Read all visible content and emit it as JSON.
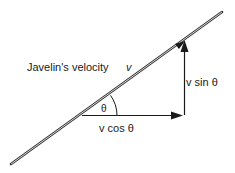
{
  "diagram": {
    "title_label": "Javelin's velocity",
    "velocity_symbol": "v",
    "angle_label": "θ",
    "horizontal_component": "v cos θ",
    "vertical_component": "v sin θ",
    "colors": {
      "line": "#1a1a1a",
      "javelin": "#333333",
      "background": "#ffffff"
    }
  }
}
